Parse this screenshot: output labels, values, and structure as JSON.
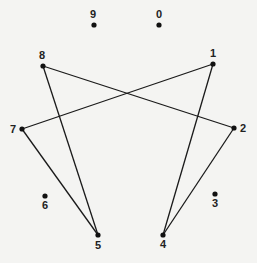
{
  "diagram": {
    "type": "graph",
    "colors": {
      "background": "#f4f4f2",
      "line": "#1a1a1a",
      "node": "#111111",
      "label": "#222222"
    },
    "nodes": [
      {
        "id": "0",
        "label": "0",
        "x": 159,
        "y": 25,
        "lx": 159,
        "ly": 18
      },
      {
        "id": "1",
        "label": "1",
        "x": 213,
        "y": 64,
        "lx": 213,
        "ly": 57
      },
      {
        "id": "2",
        "label": "2",
        "x": 234,
        "y": 128,
        "lx": 243,
        "ly": 132
      },
      {
        "id": "3",
        "label": "3",
        "x": 215,
        "y": 194,
        "lx": 215,
        "ly": 207
      },
      {
        "id": "4",
        "label": "4",
        "x": 163,
        "y": 235,
        "lx": 163,
        "ly": 248
      },
      {
        "id": "5",
        "label": "5",
        "x": 98,
        "y": 235,
        "lx": 98,
        "ly": 249
      },
      {
        "id": "6",
        "label": "6",
        "x": 45,
        "y": 196,
        "lx": 45,
        "ly": 209
      },
      {
        "id": "7",
        "label": "7",
        "x": 22,
        "y": 129,
        "lx": 13,
        "ly": 133
      },
      {
        "id": "8",
        "label": "8",
        "x": 43,
        "y": 66,
        "lx": 42,
        "ly": 59
      },
      {
        "id": "9",
        "label": "9",
        "x": 94,
        "y": 25,
        "lx": 93,
        "ly": 18
      }
    ],
    "edges": [
      {
        "from": "8",
        "to": "2"
      },
      {
        "from": "1",
        "to": "7"
      },
      {
        "from": "8",
        "to": "5"
      },
      {
        "from": "7",
        "to": "5"
      },
      {
        "from": "1",
        "to": "4"
      },
      {
        "from": "2",
        "to": "4"
      }
    ]
  }
}
